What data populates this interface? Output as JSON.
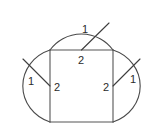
{
  "figure": {
    "background_color": "#ffffff",
    "stroke_color": "#4a4a4a",
    "label_color": "#2b2b2b",
    "canvas": {
      "width": 164,
      "height": 134
    },
    "geometry": {
      "rect_left_x": 50,
      "rect_right_x": 113,
      "rect_top_y": 50,
      "rect_bottom_y": 122,
      "top_arc_center_x": 81.5,
      "top_arc_center_y": 50,
      "top_arc_radius": 39,
      "side_arc_center_y": 86,
      "left_arc_center_x": 50,
      "right_arc_center_x": 113,
      "side_arc_radius": 38
    },
    "labels": [
      {
        "id": "top-radius",
        "text": "1",
        "x": 85,
        "y": 30
      },
      {
        "id": "top-diameter",
        "text": "2",
        "x": 81,
        "y": 60
      },
      {
        "id": "left-radius",
        "text": "1",
        "x": 31,
        "y": 82
      },
      {
        "id": "left-diameter",
        "text": "2",
        "x": 57,
        "y": 87
      },
      {
        "id": "right-diameter",
        "text": "2",
        "x": 106,
        "y": 87
      },
      {
        "id": "right-radius",
        "text": "1",
        "x": 133,
        "y": 80
      }
    ]
  }
}
